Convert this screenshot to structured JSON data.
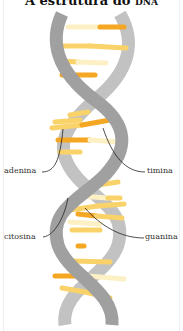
{
  "title": {
    "main": "A estrutura do ",
    "abbr": "DNA"
  },
  "labels": {
    "adenina": "adenina",
    "timina": "timina",
    "citosina": "citosina",
    "guanina": "guanina"
  },
  "colors": {
    "backbone_dark": "#9a9a9a",
    "backbone_light": "#c4c4c4",
    "base_orange": "#f5a623",
    "base_yellow": "#f9d36a",
    "base_pale": "#fdf0c4"
  }
}
